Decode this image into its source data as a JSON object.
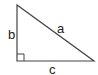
{
  "diagram": {
    "type": "right-triangle",
    "labels": {
      "hypotenuse": "a",
      "vertical_leg": "b",
      "horizontal_leg": "c"
    },
    "right_angle_marker": true,
    "colors": {
      "stroke": "#444444",
      "text": "#222222",
      "background": "#ffffff"
    }
  }
}
